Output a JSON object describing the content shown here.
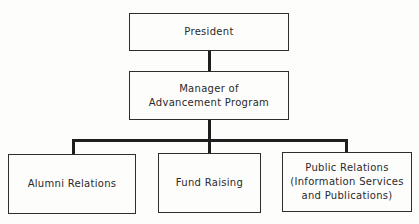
{
  "diagram": {
    "type": "org-chart",
    "nodes": {
      "president": {
        "label": "President"
      },
      "manager": {
        "label": "Manager of\nAdvancement Program"
      },
      "alumni": {
        "label": "Alumni Relations"
      },
      "fund": {
        "label": "Fund Raising"
      },
      "public": {
        "label": "Public Relations\n(Information Services\nand Publications)"
      }
    },
    "edges": [
      {
        "from": "President",
        "to": "Manager of Advancement Program"
      },
      {
        "from": "Manager of Advancement Program",
        "to": "Alumni Relations"
      },
      {
        "from": "Manager of Advancement Program",
        "to": "Fund Raising"
      },
      {
        "from": "Manager of Advancement Program",
        "to": "Public Relations (Information Services and Publications)"
      }
    ],
    "colors": {
      "line": "#1e1e1e",
      "box_border": "#2e2e2e",
      "text": "#2a2a2a",
      "background": "#fdfdfc"
    }
  }
}
